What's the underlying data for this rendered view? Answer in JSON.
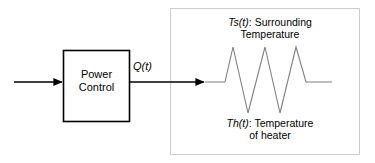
{
  "diagram": {
    "background_color": "#ffffff",
    "line_color": "#000000",
    "plant_border_color": "#cccccc",
    "waveform_color": "#7f7f7f"
  },
  "blocks": {
    "power_control": {
      "label_line1": "Power",
      "label_line2": "Control",
      "x": 63,
      "y": 50,
      "width": 67,
      "height": 72
    },
    "plant": {
      "x": 170,
      "y": 8,
      "width": 190,
      "height": 147
    }
  },
  "signals": {
    "input_arrow": {
      "name": "input-signal",
      "x1": 14,
      "y1": 82,
      "x2": 63,
      "y2": 82
    },
    "heat_flow": {
      "label_var": "Q(t)",
      "label_text": "Q(t)",
      "x1": 130,
      "y1": 82,
      "x2": 205,
      "y2": 82
    }
  },
  "annotations": {
    "surrounding": {
      "variable": "Ts(t)",
      "separator": ": ",
      "text_line1": "Surrounding",
      "text_line2": "Temperature"
    },
    "heater": {
      "variable": "Th(t)",
      "separator": ": ",
      "text_line1": "Temperature",
      "text_line2": "of heater"
    }
  },
  "chart_data": {
    "type": "line",
    "title": "",
    "xlabel": "",
    "ylabel": "",
    "series": [
      {
        "name": "temperature-waveform",
        "points": [
          [
            205,
            82
          ],
          [
            225,
            82
          ],
          [
            233,
            47
          ],
          [
            248,
            113
          ],
          [
            265,
            47
          ],
          [
            280,
            113
          ],
          [
            296,
            47
          ],
          [
            306,
            82
          ],
          [
            332,
            82
          ]
        ]
      }
    ],
    "grid": false,
    "legend": "none"
  }
}
